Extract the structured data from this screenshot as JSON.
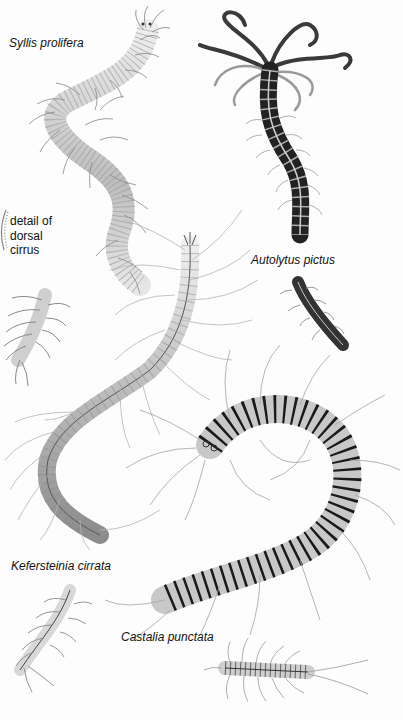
{
  "plate": {
    "labels": {
      "syllis": "Syllis prolifera",
      "detail_line1": "detail of",
      "detail_line2": "dorsal",
      "detail_line3": "cirrus",
      "autolytus": "Autolytus pictus",
      "kefersteinia": "Kefersteinia cirrata",
      "castalia": "Castalia punctata"
    },
    "colors": {
      "background": "#fdfdfd",
      "ink": "#111111",
      "pale_body": "#d9d9d9",
      "mid_body": "#9a9a9a",
      "dark_body": "#2a2a2a",
      "segment_line": "#cfcfcf"
    }
  }
}
